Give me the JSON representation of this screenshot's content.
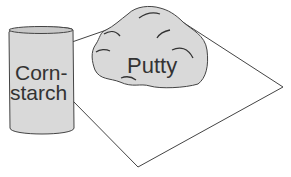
{
  "diagram": {
    "can_label_line1": "Corn-",
    "can_label_line2": "starch",
    "putty_label": "Putty",
    "colors": {
      "fill": "#d9d9d9",
      "stroke": "#444444",
      "text": "#333333"
    }
  }
}
